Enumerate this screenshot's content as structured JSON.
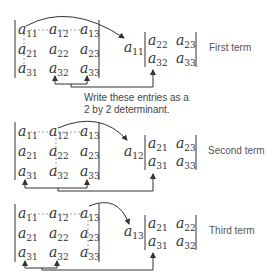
{
  "matrix3x3": {
    "r1": [
      "11",
      "12",
      "13"
    ],
    "r2": [
      "21",
      "22",
      "23"
    ],
    "r3": [
      "31",
      "32",
      "33"
    ],
    "letter": "a"
  },
  "note": {
    "line1": "Write these entries as a",
    "line2": "2 by 2 determinant."
  },
  "terms": [
    {
      "label": "First term",
      "multiplier": "11",
      "minor": {
        "r1": [
          "22",
          "23"
        ],
        "r2": [
          "32",
          "33"
        ]
      }
    },
    {
      "label": "Second term",
      "multiplier": "12",
      "minor": {
        "r1": [
          "21",
          "23"
        ],
        "r2": [
          "31",
          "33"
        ]
      }
    },
    {
      "label": "Third term",
      "multiplier": "13",
      "minor": {
        "r1": [
          "21",
          "22"
        ],
        "r2": [
          "31",
          "32"
        ]
      }
    }
  ],
  "colors": {
    "ink": "#333333",
    "label": "#555555",
    "dashed_line": "#888888"
  }
}
